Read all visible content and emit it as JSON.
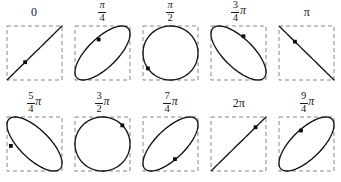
{
  "figure": {
    "title": "",
    "colors": {
      "curve": "#121212",
      "box": "#7a7a7a",
      "marker": "#0d0d0d",
      "background": "#ffffff"
    }
  },
  "chart_data": {
    "type": "scatter",
    "title": "",
    "xlabel": "",
    "ylabel": "",
    "xlim": [
      -1,
      1
    ],
    "ylim": [
      -1,
      1
    ],
    "grid": false,
    "legend": null,
    "panels": [
      {
        "id": "panel-0",
        "label": "0",
        "label_kind": "plain",
        "numerator": null,
        "denominator": null,
        "has_pi": false,
        "phase_radians": 0.0,
        "shape": "line",
        "orientation": "diagonal-up",
        "marker_t_degrees": 225,
        "marker_x": -0.34,
        "marker_y": -0.34
      },
      {
        "id": "panel-1",
        "label": "π/4",
        "label_kind": "fraction",
        "numerator": "π",
        "denominator": "4",
        "has_pi": false,
        "phase_radians": 0.7853981634,
        "shape": "ellipse",
        "orientation": "diagonal-up",
        "marker_t_degrees": 120,
        "marker_x": -0.14,
        "marker_y": 0.5
      },
      {
        "id": "panel-2",
        "label": "π/2",
        "label_kind": "fraction",
        "numerator": "π",
        "denominator": "2",
        "has_pi": false,
        "phase_radians": 1.5707963268,
        "shape": "circle",
        "orientation": "none",
        "marker_t_degrees": 215,
        "marker_x": -0.82,
        "marker_y": -0.57
      },
      {
        "id": "panel-3",
        "label": "3/4 π",
        "label_kind": "fraction-pi",
        "numerator": "3",
        "denominator": "4",
        "has_pi": true,
        "phase_radians": 2.3561944902,
        "shape": "ellipse",
        "orientation": "diagonal-down",
        "marker_t_degrees": 62,
        "marker_x": 0.18,
        "marker_y": 0.62
      },
      {
        "id": "panel-4",
        "label": "π",
        "label_kind": "plain",
        "numerator": null,
        "denominator": null,
        "has_pi": true,
        "phase_radians": 3.1415926536,
        "shape": "line",
        "orientation": "diagonal-down",
        "marker_t_degrees": 150,
        "marker_x": -0.42,
        "marker_y": 0.42
      },
      {
        "id": "panel-5",
        "label": "5/4 π",
        "label_kind": "fraction-pi",
        "numerator": "5",
        "denominator": "4",
        "has_pi": true,
        "phase_radians": 3.926990817,
        "shape": "ellipse",
        "orientation": "diagonal-down",
        "marker_t_degrees": 195,
        "marker_x": -0.86,
        "marker_y": -0.07
      },
      {
        "id": "panel-6",
        "label": "3/2 π",
        "label_kind": "fraction-pi",
        "numerator": "3",
        "denominator": "2",
        "has_pi": true,
        "phase_radians": 4.7123889804,
        "shape": "circle",
        "orientation": "none",
        "marker_t_degrees": 40,
        "marker_x": 0.72,
        "marker_y": 0.69
      },
      {
        "id": "panel-7",
        "label": "7/4 π",
        "label_kind": "fraction-pi",
        "numerator": "7",
        "denominator": "4",
        "has_pi": true,
        "phase_radians": 5.4977871438,
        "shape": "ellipse",
        "orientation": "diagonal-up",
        "marker_t_degrees": 300,
        "marker_x": 0.16,
        "marker_y": -0.56
      },
      {
        "id": "panel-8",
        "label": "2π",
        "label_kind": "plain",
        "numerator": null,
        "denominator": null,
        "has_pi": true,
        "phase_radians": 6.2831853072,
        "shape": "line",
        "orientation": "diagonal-up",
        "marker_t_degrees": 42,
        "marker_x": 0.62,
        "marker_y": 0.62
      },
      {
        "id": "panel-9",
        "label": "9/4 π",
        "label_kind": "fraction-pi",
        "numerator": "9",
        "denominator": "4",
        "has_pi": true,
        "phase_radians": 7.0685834706,
        "shape": "ellipse",
        "orientation": "diagonal-up",
        "marker_t_degrees": 123,
        "marker_x": -0.2,
        "marker_y": 0.5
      }
    ]
  }
}
